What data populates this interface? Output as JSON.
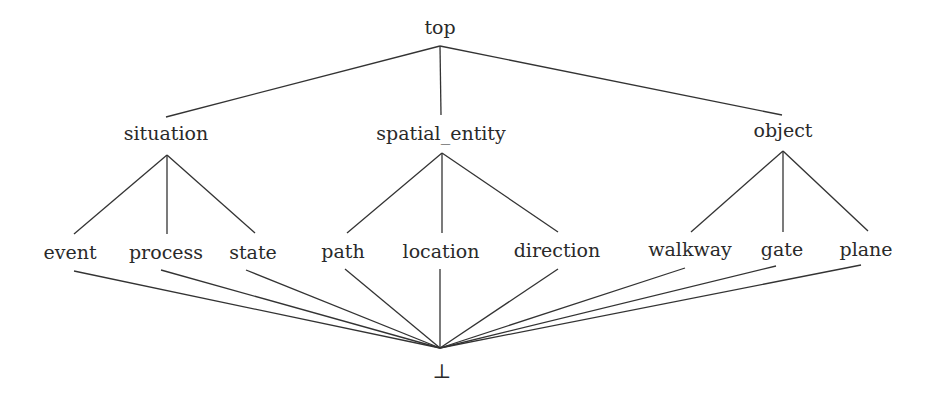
{
  "diagram": {
    "type": "lattice",
    "colors": {
      "line": "#333333",
      "text": "#2a2a2a",
      "background": "#ffffff"
    },
    "nodes": {
      "top": {
        "label": "top",
        "x": 440,
        "y": 27,
        "up": [
          440,
          46
        ],
        "down": [
          440,
          46
        ]
      },
      "situation": {
        "label": "situation",
        "x": 166,
        "y": 133,
        "up": [
          166,
          117
        ],
        "down": [
          167,
          155
        ]
      },
      "spatial_entity": {
        "label": "spatial_entity",
        "x": 441,
        "y": 133,
        "up": [
          441,
          115
        ],
        "down": [
          442,
          153
        ]
      },
      "object": {
        "label": "object",
        "x": 783,
        "y": 130,
        "up": [
          782,
          115
        ],
        "down": [
          783,
          151
        ]
      },
      "event": {
        "label": "event",
        "x": 70,
        "y": 252,
        "up": [
          74,
          234
        ],
        "down": [
          74,
          271
        ]
      },
      "process": {
        "label": "process",
        "x": 166,
        "y": 252,
        "up": [
          167,
          234
        ],
        "down": [
          161,
          270
        ]
      },
      "state": {
        "label": "state",
        "x": 253,
        "y": 252,
        "up": [
          255,
          233
        ],
        "down": [
          246,
          270
        ]
      },
      "path": {
        "label": "path",
        "x": 343,
        "y": 251,
        "up": [
          347,
          233
        ],
        "down": [
          345,
          269
        ]
      },
      "location": {
        "label": "location",
        "x": 441,
        "y": 251,
        "up": [
          442,
          233
        ],
        "down": [
          440,
          269
        ]
      },
      "direction": {
        "label": "direction",
        "x": 557,
        "y": 250,
        "up": [
          558,
          232
        ],
        "down": [
          558,
          269
        ]
      },
      "walkway": {
        "label": "walkway",
        "x": 690,
        "y": 249,
        "up": [
          691,
          232
        ],
        "down": [
          685,
          268
        ]
      },
      "gate": {
        "label": "gate",
        "x": 782,
        "y": 249,
        "up": [
          783,
          232
        ],
        "down": [
          776,
          266
        ]
      },
      "plane": {
        "label": "plane",
        "x": 866,
        "y": 249,
        "up": [
          868,
          231
        ],
        "down": [
          861,
          265
        ]
      },
      "bottom": {
        "label": "⊥",
        "x": 442,
        "y": 371,
        "up": [
          440,
          348
        ],
        "down": [
          440,
          348
        ]
      }
    },
    "edges": [
      [
        "top",
        "situation"
      ],
      [
        "top",
        "spatial_entity"
      ],
      [
        "top",
        "object"
      ],
      [
        "situation",
        "event"
      ],
      [
        "situation",
        "process"
      ],
      [
        "situation",
        "state"
      ],
      [
        "spatial_entity",
        "path"
      ],
      [
        "spatial_entity",
        "location"
      ],
      [
        "spatial_entity",
        "direction"
      ],
      [
        "object",
        "walkway"
      ],
      [
        "object",
        "gate"
      ],
      [
        "object",
        "plane"
      ],
      [
        "event",
        "bottom"
      ],
      [
        "process",
        "bottom"
      ],
      [
        "state",
        "bottom"
      ],
      [
        "path",
        "bottom"
      ],
      [
        "location",
        "bottom"
      ],
      [
        "direction",
        "bottom"
      ],
      [
        "walkway",
        "bottom"
      ],
      [
        "gate",
        "bottom"
      ],
      [
        "plane",
        "bottom"
      ]
    ]
  }
}
